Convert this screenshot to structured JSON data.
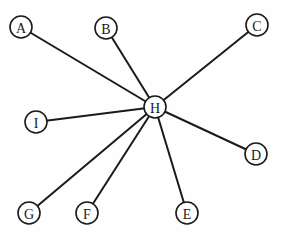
{
  "diagram": {
    "type": "star-graph",
    "center": "H",
    "colors": {
      "stroke": "#1a1a1a",
      "background": "#fefefe",
      "node_fill": "#ffffff"
    },
    "node_radius": 11,
    "nodes": [
      {
        "id": "A",
        "label": "A",
        "x": 21,
        "y": 27
      },
      {
        "id": "B",
        "label": "B",
        "x": 106,
        "y": 28
      },
      {
        "id": "C",
        "label": "C",
        "x": 257,
        "y": 25
      },
      {
        "id": "D",
        "label": "D",
        "x": 256,
        "y": 154
      },
      {
        "id": "E",
        "label": "E",
        "x": 187,
        "y": 213
      },
      {
        "id": "F",
        "label": "F",
        "x": 87,
        "y": 213
      },
      {
        "id": "G",
        "label": "G",
        "x": 29,
        "y": 213
      },
      {
        "id": "H",
        "label": "H",
        "x": 155,
        "y": 107
      },
      {
        "id": "I",
        "label": "I",
        "x": 36,
        "y": 122
      }
    ],
    "edges": [
      {
        "from": "H",
        "to": "A"
      },
      {
        "from": "H",
        "to": "B"
      },
      {
        "from": "H",
        "to": "C"
      },
      {
        "from": "H",
        "to": "D"
      },
      {
        "from": "H",
        "to": "E"
      },
      {
        "from": "H",
        "to": "F"
      },
      {
        "from": "H",
        "to": "G"
      },
      {
        "from": "H",
        "to": "I"
      }
    ]
  }
}
